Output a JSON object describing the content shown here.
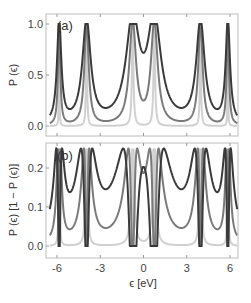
{
  "chart_data": [
    {
      "type": "line",
      "panel_label": "(a)",
      "ylabel": "P (ϵ)",
      "xlabel": "",
      "xlim": [
        -6.5,
        6.5
      ],
      "ylim": [
        -0.05,
        1.05
      ],
      "yticks": [
        "0.0",
        "0.5",
        "1.0"
      ],
      "ytick_values": [
        0,
        0.5,
        1.0
      ],
      "xticks": [
        -6,
        -3,
        0,
        3,
        6
      ],
      "grid": false,
      "series": [
        {
          "name": "strong coupling",
          "color": "#3a3a3a",
          "resonances": [
            -5.85,
            -3.95,
            -0.75,
            0.75,
            3.95,
            5.85
          ],
          "min_values_approx": {
            "-5": 0.1,
            "-2.3": 0.12,
            "0": 0.87,
            "2.3": 0.12,
            "5": 0.1
          }
        },
        {
          "name": "medium coupling",
          "color": "#7a7a7a",
          "resonances": [
            -5.85,
            -3.95,
            -0.75,
            0.75,
            3.95,
            5.85
          ],
          "min_values_approx": {
            "-5": 0.03,
            "-2.3": 0.03,
            "0": 0.35,
            "2.3": 0.03,
            "5": 0.03
          }
        },
        {
          "name": "weak coupling",
          "color": "#d0d0d0",
          "resonances": [
            -5.85,
            -3.95,
            -0.75,
            0.75,
            3.95,
            5.85
          ],
          "min_values_approx": {
            "-5": 0.0,
            "-2.3": 0.0,
            "0": 0.0,
            "2.3": 0.0,
            "5": 0.0
          }
        }
      ]
    },
    {
      "type": "line",
      "panel_label": "(b)",
      "ylabel": "P (ϵ) [1 − P (ϵ)]",
      "xlabel": "ϵ [eV]",
      "xlim": [
        -6.5,
        6.5
      ],
      "ylim": [
        -0.012,
        0.27
      ],
      "yticks": [
        "0.0",
        "0.1",
        "0.2"
      ],
      "ytick_values": [
        0,
        0.1,
        0.2
      ],
      "xticks": [
        -6,
        -3,
        0,
        3,
        6
      ],
      "xtick_labels": [
        "-6",
        "-3",
        "0",
        "3",
        "6"
      ],
      "grid": false,
      "note": "Derived as P(1-P) from panel (a); maximum 0.25",
      "series": [
        {
          "name": "strong coupling",
          "color": "#3a3a3a"
        },
        {
          "name": "medium coupling",
          "color": "#7a7a7a"
        },
        {
          "name": "weak coupling",
          "color": "#d0d0d0"
        }
      ]
    }
  ],
  "model": {
    "peaks": [
      -5.85,
      -3.95,
      -0.75,
      0.75,
      3.95,
      5.85
    ],
    "widths": [
      {
        "peak_w": [
          0.18,
          0.35,
          0.55,
          0.55,
          0.35,
          0.18
        ],
        "floor": 0.0
      },
      {
        "peak_w": [
          0.09,
          0.18,
          0.28,
          0.28,
          0.18,
          0.09
        ],
        "floor": 0.0
      },
      {
        "peak_w": [
          0.02,
          0.04,
          0.06,
          0.06,
          0.04,
          0.02
        ],
        "floor": 0.0
      }
    ]
  }
}
